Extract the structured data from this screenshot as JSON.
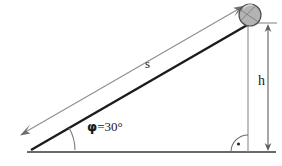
{
  "figure": {
    "type": "inclined-plane-diagram",
    "background_color": "#ffffff",
    "line_color": "#3f3f3f",
    "incline_color": "#1c1c1c",
    "dimension_color": "#6e6e6e",
    "ball_fill": "#b0b0b0",
    "ball_stroke": "#4a4a4a",
    "labels": {
      "slope_length": "s",
      "height": "h",
      "angle_symbol": "φ",
      "angle_equals": "=",
      "angle_value": "30°",
      "angle_full": "φ = 30°"
    },
    "geometry": {
      "base_left_x": 27,
      "base_right_x": 276,
      "base_y": 152,
      "apex_x": 31,
      "apex_y": 150,
      "top_x": 248,
      "top_y": 23,
      "ball_center_x": 250,
      "ball_center_y": 15,
      "ball_radius": 11,
      "height_line_x": 248,
      "height_arrow_x": 268,
      "angle_arc_radius": 44,
      "right_angle_marker_radius": 17
    },
    "annotations": {
      "right_angle_marker": "right-angle-dot",
      "slope_arrow": "double-ended-dimension-line",
      "height_arrow": "double-ended-dimension-line"
    }
  }
}
